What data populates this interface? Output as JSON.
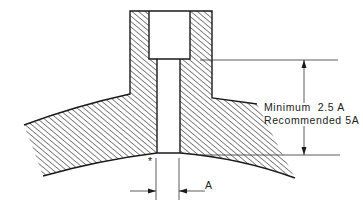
{
  "diagram": {
    "type": "engineering-cross-section",
    "dimension_note": {
      "line1": "Minimum  2.5 A",
      "line2": "Recommended 5A"
    },
    "bore_label": "A",
    "asterisk": "*",
    "colors": {
      "ink": "#1a1a1a",
      "background": "#ffffff"
    }
  }
}
